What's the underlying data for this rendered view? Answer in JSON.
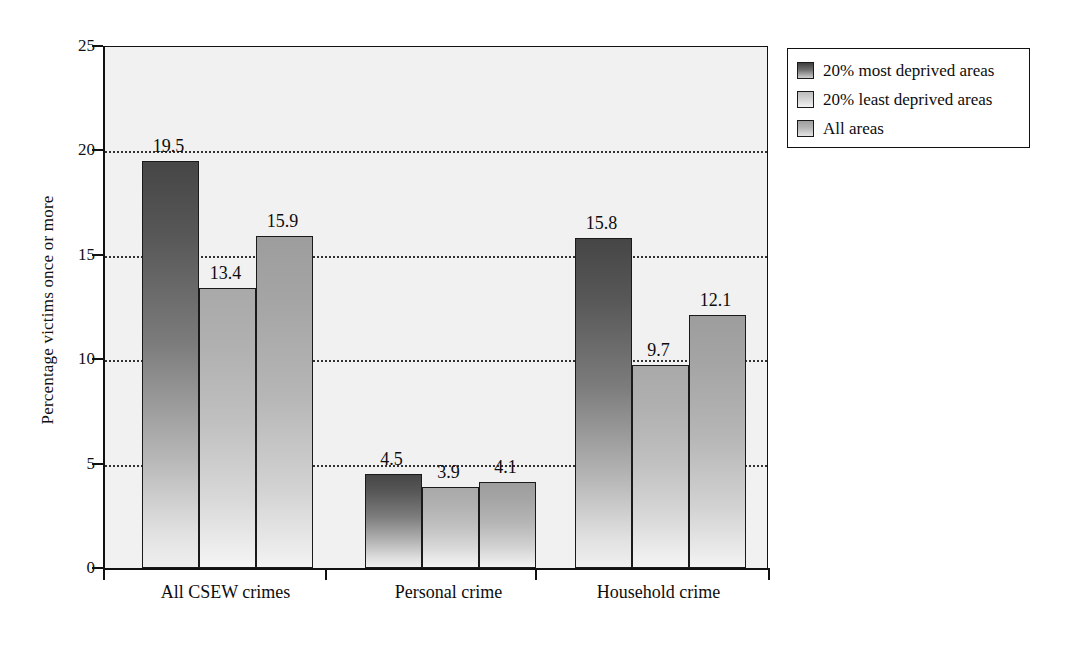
{
  "chart_data": {
    "type": "bar",
    "title": "",
    "xlabel": "",
    "ylabel": "Percentage victims once or more",
    "ylim": [
      0,
      25
    ],
    "yticks": [
      "0",
      "5",
      "10",
      "15",
      "20",
      "25"
    ],
    "ytick_values": [
      0,
      5,
      10,
      15,
      20,
      25
    ],
    "gridlines": [
      5,
      10,
      15,
      20
    ],
    "grid": true,
    "legend_position": "top-right",
    "categories": [
      "All CSEW crimes",
      "Personal crime",
      "Household crime"
    ],
    "series": [
      {
        "name": "20% most deprived areas",
        "color": "#464646",
        "values": [
          19.5,
          4.5,
          15.8
        ],
        "labels": [
          "19.5",
          "4.5",
          "15.8"
        ]
      },
      {
        "name": "20% least deprived areas",
        "color": "#a9a9a9",
        "values": [
          13.4,
          3.9,
          9.7
        ],
        "labels": [
          "13.4",
          "3.9",
          "9.7"
        ]
      },
      {
        "name": "All areas",
        "color": "#9d9d9d",
        "values": [
          15.9,
          4.1,
          12.1
        ],
        "labels": [
          "15.9",
          "4.1",
          "12.1"
        ]
      }
    ]
  }
}
